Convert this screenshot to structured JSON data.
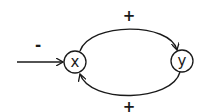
{
  "diagram": {
    "type": "causal-loop",
    "nodes": [
      {
        "id": "x",
        "label": "x"
      },
      {
        "id": "y",
        "label": "y"
      }
    ],
    "edges": [
      {
        "from": "input",
        "to": "x",
        "sign": "-"
      },
      {
        "from": "x",
        "to": "y",
        "sign": "+"
      },
      {
        "from": "y",
        "to": "x",
        "sign": "+"
      }
    ],
    "colors": {
      "stroke": "#1a1a1a",
      "background": "#ffffff"
    }
  }
}
